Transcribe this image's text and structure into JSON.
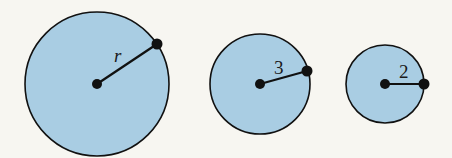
{
  "colors": {
    "background": "#f7f6f1",
    "circle_fill": "#a9cde3",
    "stroke": "#111111"
  },
  "circles": [
    {
      "id": "large",
      "cx": 97,
      "cy": 84,
      "r": 72,
      "px": 157,
      "py": 44,
      "label": "r",
      "lx": 114,
      "ly": 62,
      "italic": true
    },
    {
      "id": "medium",
      "cx": 260,
      "cy": 84,
      "r": 50,
      "px": 307,
      "py": 71,
      "label": "3",
      "lx": 274,
      "ly": 74,
      "italic": false
    },
    {
      "id": "small",
      "cx": 385,
      "cy": 84,
      "r": 39,
      "px": 424,
      "py": 84,
      "label": "2",
      "lx": 399,
      "ly": 78,
      "italic": false
    }
  ]
}
